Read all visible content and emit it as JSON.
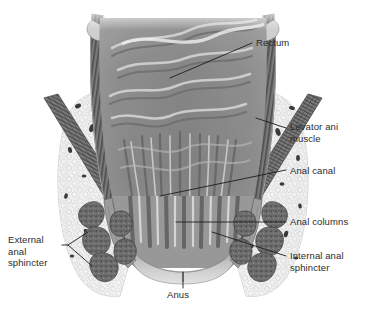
{
  "figure": {
    "type": "anatomical-illustration",
    "style": "grayscale halftone medical illustration",
    "background_color": "#ffffff"
  },
  "labels": {
    "rectum": "Rectum",
    "levator_ani": "Levator ani\nmuscle",
    "anal_canal": "Anal canal",
    "anal_columns": "Anal columns",
    "internal_anal_sphincter": "Internal anal\nsphincter",
    "external_anal_sphincter": "External\nanal\nsphincter",
    "anus": "Anus"
  },
  "colors": {
    "text": "#2b2b2b",
    "leader_line": "#1d1d1d",
    "mucosa_mid": "#8a8a8a",
    "mucosa_dark": "#6e6e6e",
    "mucosa_light": "#d2d2d2",
    "wall_dark": "#5a5a5a",
    "fat_light": "#efefef",
    "fat_outline": "#b9b9b9",
    "sphincter": "#6b6b6b",
    "sphincter_dark": "#4f4f4f",
    "muscle_band": "#6a6a6a",
    "vessel": "#3a3a3a"
  },
  "structures": [
    {
      "name": "rectum",
      "description": "upper dilated chamber with mucosal folds"
    },
    {
      "name": "rectal-wall",
      "description": "striped muscular wall flanking the lumen"
    },
    {
      "name": "levator-ani-muscle",
      "description": "diagonal striated muscle bands, both sides"
    },
    {
      "name": "anal-canal",
      "description": "narrow lower passage"
    },
    {
      "name": "anal-columns",
      "description": "vertical mucosal ridges in anal canal"
    },
    {
      "name": "internal-anal-sphincter",
      "description": "smooth muscle ring adjacent to canal"
    },
    {
      "name": "external-anal-sphincter",
      "description": "stippled skeletal muscle bundles lateral to canal"
    },
    {
      "name": "ischioanal-fat",
      "description": "pale vacuolated fatty tissue with vessels"
    },
    {
      "name": "anus",
      "description": "external opening at base"
    }
  ]
}
